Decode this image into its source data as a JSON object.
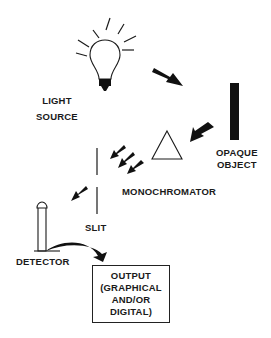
{
  "diagram": {
    "components": {
      "light_source": {
        "label_line1": "LIGHT",
        "label_line2": "SOURCE",
        "icon": "light-bulb-icon"
      },
      "opaque_object": {
        "label_line1": "OPAQUE",
        "label_line2": "OBJECT",
        "icon": "black-bar"
      },
      "monochromator": {
        "label": "MONOCHROMATOR",
        "icon": "triangle-prism-icon"
      },
      "slit": {
        "label": "SLIT",
        "icon": "vertical-slit-lines"
      },
      "detector": {
        "label": "DETECTOR",
        "icon": "detector-tube-icon"
      },
      "output": {
        "line1": "OUTPUT",
        "line2": "(GRAPHICAL",
        "line3": "AND/OR",
        "line4": "DIGITAL)"
      }
    },
    "flow": [
      "LIGHT SOURCE",
      "OPAQUE OBJECT",
      "MONOCHROMATOR",
      "SLIT",
      "DETECTOR",
      "OUTPUT"
    ],
    "colors": {
      "ink": "#1a1a1a",
      "background": "#ffffff"
    }
  }
}
